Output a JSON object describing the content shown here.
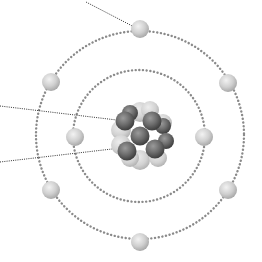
{
  "diagram": {
    "background": "#ffffff",
    "colors": {
      "orbit": "#8a8a8a",
      "leader": "#333333",
      "electron_light": "#ececec",
      "electron_dark": "#a9a9a9",
      "proton_light": "#e4e4e4",
      "proton_dark": "#b4b4b4",
      "neutron_light": "#8e8e8e",
      "neutron_dark": "#3f3f3f"
    },
    "nucleus": {
      "center": [
        140,
        136
      ],
      "proton_count_visible": 8,
      "neutron_count_visible": 7
    },
    "orbits": [
      {
        "name": "inner-shell",
        "center": [
          139,
          136
        ],
        "radius": 66,
        "electrons": 2
      },
      {
        "name": "outer-shell",
        "center": [
          140,
          135
        ],
        "radius": 104,
        "electrons": 6
      }
    ],
    "electrons": [
      {
        "shell": "inner",
        "x": 75,
        "y": 137
      },
      {
        "shell": "inner",
        "x": 204,
        "y": 137
      },
      {
        "shell": "outer",
        "x": 140,
        "y": 29
      },
      {
        "shell": "outer",
        "x": 51,
        "y": 82
      },
      {
        "shell": "outer",
        "x": 228,
        "y": 83
      },
      {
        "shell": "outer",
        "x": 51,
        "y": 190
      },
      {
        "shell": "outer",
        "x": 228,
        "y": 190
      },
      {
        "shell": "outer",
        "x": 140,
        "y": 242
      }
    ],
    "leader_lines": [
      {
        "points_to": "electron",
        "x1": 86,
        "y1": 2,
        "x2": 140,
        "y2": 30
      },
      {
        "points_to": "neutron",
        "x1": 0,
        "y1": 106,
        "x2": 125,
        "y2": 121
      },
      {
        "points_to": "proton",
        "x1": 0,
        "y1": 162,
        "x2": 112,
        "y2": 149
      }
    ]
  }
}
